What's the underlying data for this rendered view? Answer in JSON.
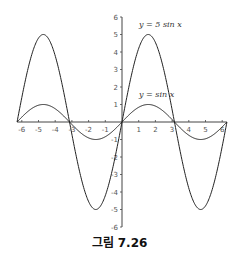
{
  "caption": "그림 7.26",
  "chart_data": {
    "type": "line",
    "title": "",
    "xlabel": "",
    "ylabel": "",
    "xlim": [
      -6.283,
      6.283
    ],
    "ylim": [
      -6,
      6
    ],
    "grid": false,
    "x_ticks": [
      -6,
      -5,
      -4,
      -3,
      -2,
      -1,
      1,
      2,
      3,
      4,
      5,
      6
    ],
    "y_ticks": [
      -6,
      -5,
      -4,
      -3,
      -2,
      -1,
      1,
      2,
      3,
      4,
      5,
      6
    ],
    "series": [
      {
        "name": "y = 5 sin x",
        "function": "5*sin(x)",
        "amplitude": 5,
        "label_pos": [
          0.3,
          5.6
        ]
      },
      {
        "name": "y = sin x",
        "function": "sin(x)",
        "amplitude": 1,
        "label_pos": [
          0.3,
          1.6
        ]
      }
    ],
    "legend": "inline annotations"
  }
}
